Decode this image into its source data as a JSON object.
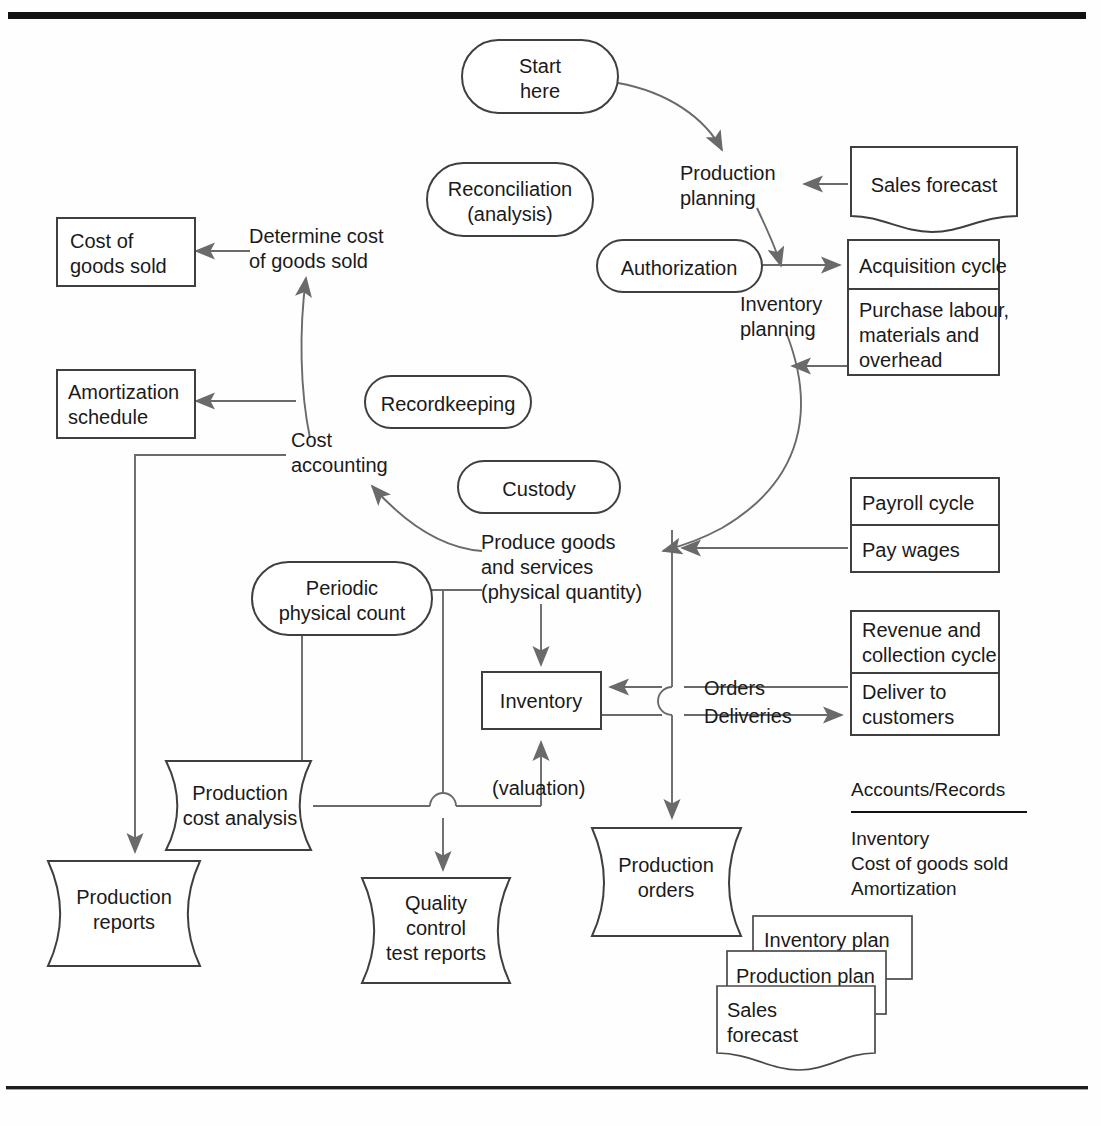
{
  "diagram": {
    "frame": {
      "top_rule": "thick-black-rule",
      "bottom_rule": "thin-black-rule"
    },
    "colors": {
      "background": "#fefefe",
      "shape_stroke": "#3f3f3f",
      "connector": "#6a6a6a",
      "text": "#1a1a1a",
      "rule": "#111111"
    },
    "nodes": {
      "start_here": "Start\nhere",
      "start_here_l1": "Start",
      "start_here_l2": "here",
      "reconciliation_l1": "Reconciliation",
      "reconciliation_l2": "(analysis)",
      "authorization": "Authorization",
      "recordkeeping": "Recordkeeping",
      "custody": "Custody",
      "periodic_count_l1": "Periodic",
      "periodic_count_l2": "physical count",
      "production_planning_l1": "Production",
      "production_planning_l2": "planning",
      "inventory_planning_l1": "Inventory",
      "inventory_planning_l2": "planning",
      "sales_forecast": "Sales forecast",
      "acquisition_cycle": "Acquisition cycle",
      "purchase_l1": "Purchase labour,",
      "purchase_l2": "materials and",
      "purchase_l3": "overhead",
      "payroll_cycle": "Payroll cycle",
      "pay_wages": "Pay wages",
      "revenue_cycle_l1": "Revenue and",
      "revenue_cycle_l2": "collection cycle",
      "deliver_l1": "Deliver to",
      "deliver_l2": "customers",
      "cost_of_goods_sold_l1": "Cost of",
      "cost_of_goods_sold_l2": "goods sold",
      "determine_cost_l1": "Determine cost",
      "determine_cost_l2": "of goods sold",
      "amortization_l1": "Amortization",
      "amortization_l2": "schedule",
      "cost_accounting_l1": "Cost",
      "cost_accounting_l2": "accounting",
      "produce_goods_l1": "Produce goods",
      "produce_goods_l2": "and services",
      "produce_goods_l3": "(physical quantity)",
      "inventory": "Inventory",
      "valuation": "(valuation)",
      "orders": "Orders",
      "deliveries": "Deliveries",
      "production_cost_analysis_l1": "Production",
      "production_cost_analysis_l2": "cost analysis",
      "production_reports_l1": "Production",
      "production_reports_l2": "reports",
      "quality_control_l1": "Quality",
      "quality_control_l2": "control",
      "quality_control_l3": "test reports",
      "production_orders_l1": "Production",
      "production_orders_l2": "orders",
      "inventory_plan": "Inventory plan",
      "production_plan": "Production plan",
      "stack_sales_forecast_l1": "Sales",
      "stack_sales_forecast_l2": "forecast"
    },
    "legend": {
      "heading": "Accounts/Records",
      "items": [
        "Inventory",
        "Cost of goods sold",
        "Amortization"
      ]
    }
  }
}
